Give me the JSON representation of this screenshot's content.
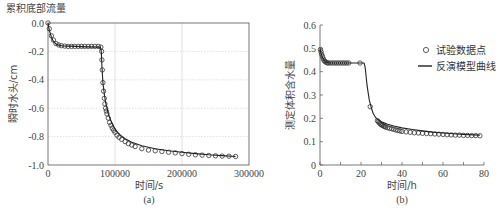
{
  "chart_data": [
    {
      "type": "line",
      "panel_label": "(a)",
      "title": "累积底部流量",
      "xlabel": "时间/s",
      "ylabel": "瞬时水头/cm",
      "xlim": [
        0,
        300000
      ],
      "ylim": [
        -1.0,
        0.0
      ],
      "xticks": [
        "0",
        "100000",
        "200000",
        "300000"
      ],
      "xtick_values": [
        0,
        100000,
        200000,
        300000
      ],
      "yticks": [
        "0.0",
        "-0.2",
        "-0.4",
        "-0.6",
        "-0.8",
        "-1.0"
      ],
      "ytick_values": [
        0.0,
        -0.2,
        -0.4,
        -0.6,
        -0.8,
        -1.0
      ],
      "grid": true,
      "series": [
        {
          "name": "试验数据点",
          "style": "markers",
          "x": [
            0,
            2000,
            5000,
            8000,
            12000,
            16000,
            20000,
            25000,
            30000,
            35000,
            40000,
            45000,
            50000,
            55000,
            60000,
            65000,
            70000,
            75000,
            79000,
            80000,
            80500,
            81000,
            82000,
            83000,
            84000,
            85000,
            86000,
            87000,
            88000,
            90000,
            92000,
            94000,
            96000,
            98000,
            100000,
            103000,
            106000,
            110000,
            115000,
            120000,
            125000,
            130000,
            140000,
            150000,
            160000,
            170000,
            180000,
            190000,
            200000,
            210000,
            220000,
            230000,
            240000,
            250000,
            260000,
            270000,
            280000
          ],
          "y": [
            0.0,
            -0.04,
            -0.09,
            -0.12,
            -0.145,
            -0.155,
            -0.16,
            -0.163,
            -0.165,
            -0.165,
            -0.165,
            -0.165,
            -0.165,
            -0.165,
            -0.165,
            -0.165,
            -0.165,
            -0.165,
            -0.17,
            -0.2,
            -0.26,
            -0.33,
            -0.42,
            -0.48,
            -0.53,
            -0.57,
            -0.6,
            -0.62,
            -0.64,
            -0.67,
            -0.7,
            -0.72,
            -0.74,
            -0.755,
            -0.77,
            -0.79,
            -0.805,
            -0.82,
            -0.835,
            -0.85,
            -0.86,
            -0.87,
            -0.885,
            -0.895,
            -0.9,
            -0.905,
            -0.91,
            -0.915,
            -0.92,
            -0.925,
            -0.928,
            -0.93,
            -0.933,
            -0.935,
            -0.937,
            -0.938,
            -0.94
          ]
        },
        {
          "name": "反演模型曲线",
          "style": "line",
          "x": [
            0,
            2000,
            5000,
            8000,
            12000,
            16000,
            20000,
            30000,
            40000,
            60000,
            78000,
            79500,
            80500,
            82000,
            84000,
            86000,
            88000,
            90000,
            94000,
            98000,
            102000,
            108000,
            115000,
            125000,
            140000,
            160000,
            180000,
            200000,
            220000,
            240000,
            260000,
            280000
          ],
          "y": [
            0.0,
            -0.05,
            -0.1,
            -0.13,
            -0.148,
            -0.157,
            -0.16,
            -0.163,
            -0.165,
            -0.168,
            -0.17,
            -0.2,
            -0.3,
            -0.42,
            -0.5,
            -0.56,
            -0.6,
            -0.64,
            -0.69,
            -0.73,
            -0.76,
            -0.79,
            -0.815,
            -0.84,
            -0.865,
            -0.885,
            -0.9,
            -0.91,
            -0.92,
            -0.928,
            -0.934,
            -0.94
          ]
        }
      ]
    },
    {
      "type": "line",
      "panel_label": "(b)",
      "title": "",
      "xlabel": "时间/h",
      "ylabel": "测定体积含水量",
      "xlim": [
        0,
        80
      ],
      "ylim": [
        0,
        0.6
      ],
      "xticks": [
        "0",
        "20",
        "40",
        "60",
        "80"
      ],
      "xtick_values": [
        0,
        20,
        40,
        60,
        80
      ],
      "yticks": [
        "0",
        "0.1",
        "0.2",
        "0.3",
        "0.4",
        "0.5",
        "0.6"
      ],
      "ytick_values": [
        0,
        0.1,
        0.2,
        0.3,
        0.4,
        0.5,
        0.6
      ],
      "grid": false,
      "legend": {
        "position": "top-right",
        "entries": [
          {
            "label": "试验数据点",
            "style": "markers"
          },
          {
            "label": "反演模型曲线",
            "style": "line"
          }
        ]
      },
      "series": [
        {
          "name": "试验数据点",
          "style": "markers",
          "x": [
            0.2,
            0.5,
            0.8,
            1.2,
            1.6,
            2.0,
            2.5,
            3.0,
            3.5,
            4.0,
            5.0,
            6.0,
            7.0,
            8.0,
            9.0,
            10.0,
            11.0,
            12.0,
            13.0,
            14.0,
            19.5,
            24.5,
            28.0,
            28.5,
            29.0,
            29.5,
            30.0,
            30.5,
            31.0,
            31.5,
            32.0,
            33.0,
            34.0,
            35.0,
            36.0,
            37.0,
            38.0,
            39.0,
            40.0,
            42.0,
            44.0,
            46.0,
            48.0,
            50.0,
            52.0,
            54.0,
            56.0,
            58.0,
            60.0,
            62.0,
            64.0,
            66.0,
            68.0,
            70.0,
            72.0,
            74.0,
            76.0,
            78.0
          ],
          "y": [
            0.495,
            0.485,
            0.475,
            0.465,
            0.455,
            0.448,
            0.443,
            0.44,
            0.438,
            0.437,
            0.437,
            0.437,
            0.437,
            0.437,
            0.437,
            0.437,
            0.437,
            0.437,
            0.437,
            0.437,
            0.437,
            0.25,
            0.19,
            0.185,
            0.18,
            0.175,
            0.172,
            0.17,
            0.167,
            0.165,
            0.163,
            0.16,
            0.157,
            0.155,
            0.153,
            0.15,
            0.148,
            0.146,
            0.144,
            0.142,
            0.14,
            0.138,
            0.137,
            0.136,
            0.135,
            0.134,
            0.133,
            0.132,
            0.131,
            0.13,
            0.129,
            0.128,
            0.128,
            0.127,
            0.127,
            0.126,
            0.126,
            0.125
          ]
        },
        {
          "name": "反演模型曲线",
          "style": "line",
          "x": [
            0,
            0.5,
            1,
            2,
            3,
            4,
            6,
            10,
            15,
            20,
            21.5,
            22,
            22.5,
            23,
            24,
            25,
            26,
            27,
            28,
            30,
            33,
            36,
            40,
            45,
            50,
            55,
            60,
            65,
            70,
            75,
            78
          ],
          "y": [
            0.5,
            0.48,
            0.465,
            0.448,
            0.44,
            0.438,
            0.437,
            0.437,
            0.437,
            0.437,
            0.437,
            0.42,
            0.38,
            0.34,
            0.28,
            0.245,
            0.22,
            0.205,
            0.195,
            0.185,
            0.175,
            0.167,
            0.159,
            0.152,
            0.146,
            0.141,
            0.137,
            0.134,
            0.131,
            0.129,
            0.128
          ]
        }
      ]
    }
  ]
}
